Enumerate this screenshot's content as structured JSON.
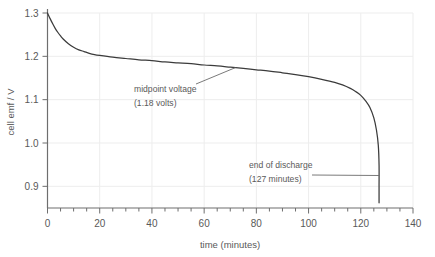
{
  "chart_data": {
    "type": "line",
    "title": "",
    "xlabel": "time (minutes)",
    "ylabel": "cell emf / V",
    "xlim": [
      0,
      140
    ],
    "ylim": [
      0.85,
      1.3
    ],
    "grid": true,
    "legend": "none",
    "x_major_ticks": [
      0,
      20,
      40,
      60,
      80,
      100,
      120,
      140
    ],
    "x_major_tick_labels": [
      "0",
      "20",
      "40",
      "60",
      "80",
      "100",
      "120",
      "140"
    ],
    "x_minor_tick_step": 5,
    "y_major_ticks": [
      0.9,
      1.0,
      1.1,
      1.2,
      1.3
    ],
    "y_major_tick_labels": [
      "0.9",
      "1.0",
      "1.1",
      "1.2",
      "1.3"
    ],
    "series": [
      {
        "name": "cell emf",
        "x": [
          0,
          1,
          2,
          3,
          4,
          5,
          6,
          8,
          10,
          12,
          14,
          16,
          18,
          20,
          25,
          30,
          35,
          40,
          45,
          50,
          55,
          60,
          65,
          70,
          75,
          80,
          85,
          90,
          95,
          100,
          105,
          110,
          113,
          116,
          118,
          120,
          122,
          123.5,
          125,
          126,
          126.7,
          127,
          127,
          127
        ],
        "y": [
          1.3,
          1.287,
          1.275,
          1.264,
          1.255,
          1.247,
          1.24,
          1.229,
          1.221,
          1.215,
          1.211,
          1.207,
          1.204,
          1.202,
          1.198,
          1.195,
          1.192,
          1.19,
          1.187,
          1.185,
          1.183,
          1.18,
          1.178,
          1.175,
          1.172,
          1.169,
          1.166,
          1.162,
          1.158,
          1.153,
          1.147,
          1.14,
          1.134,
          1.126,
          1.119,
          1.11,
          1.096,
          1.082,
          1.058,
          1.03,
          0.995,
          0.95,
          0.9,
          0.862
        ]
      }
    ],
    "annotations": [
      {
        "id": "midpoint",
        "line1": "midpoint voltage",
        "line2": "(1.18 volts)",
        "point_x": 72,
        "point_y": 1.174
      },
      {
        "id": "end-of-discharge",
        "line1": "end of discharge",
        "line2": "(127 minutes)",
        "point_x": 127,
        "point_y": 0.925
      }
    ],
    "colors": {
      "curve": "#3b3b3b",
      "axis": "#6e6e6e",
      "grid": "#ededed",
      "text": "#595959",
      "background": "#ffffff"
    }
  }
}
